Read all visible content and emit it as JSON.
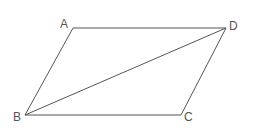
{
  "diagram": {
    "type": "parallelogram-with-diagonal",
    "stroke_color": "#555555",
    "background": "#ffffff",
    "vertices": {
      "A": {
        "label": "A",
        "x": 73,
        "y": 28
      },
      "D": {
        "label": "D",
        "x": 226,
        "y": 28
      },
      "C": {
        "label": "C",
        "x": 181,
        "y": 115
      },
      "B": {
        "label": "B",
        "x": 25,
        "y": 115
      }
    },
    "edges": [
      [
        "A",
        "D"
      ],
      [
        "D",
        "C"
      ],
      [
        "C",
        "B"
      ],
      [
        "B",
        "A"
      ],
      [
        "B",
        "D"
      ]
    ],
    "labels": {
      "A": "A",
      "B": "B",
      "C": "C",
      "D": "D"
    }
  }
}
